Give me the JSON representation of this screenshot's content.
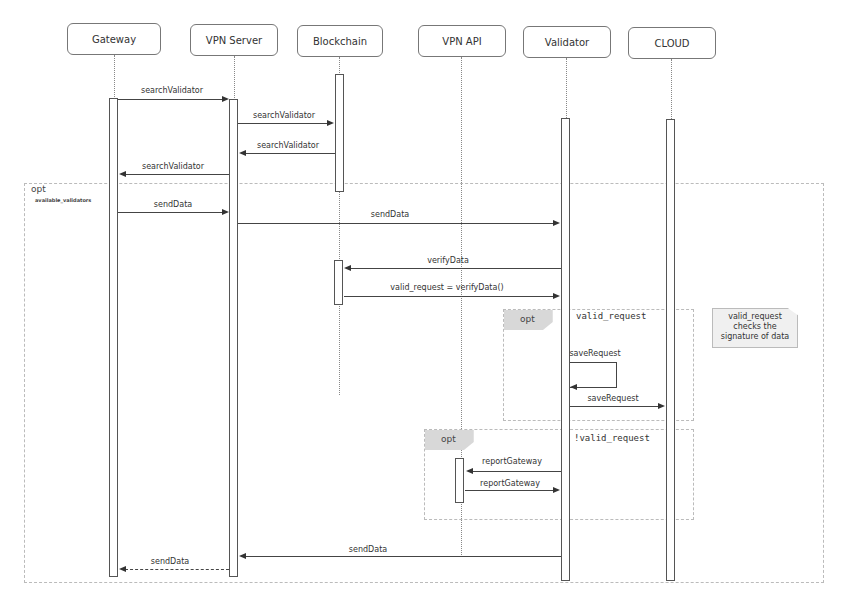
{
  "participants": [
    {
      "id": "gateway",
      "label": "Gateway"
    },
    {
      "id": "vpn_server",
      "label": "VPN Server"
    },
    {
      "id": "blockchain",
      "label": "Blockchain"
    },
    {
      "id": "vpn_api",
      "label": "VPN API"
    },
    {
      "id": "validator",
      "label": "Validator"
    },
    {
      "id": "cloud",
      "label": "CLOUD"
    }
  ],
  "messages": [
    {
      "from": "Gateway",
      "to": "VPN Server",
      "label": "searchValidator"
    },
    {
      "from": "VPN Server",
      "to": "Blockchain",
      "label": "searchValidator"
    },
    {
      "from": "Blockchain",
      "to": "VPN Server",
      "label": "searchValidator"
    },
    {
      "from": "VPN Server",
      "to": "Gateway",
      "label": "searchValidator"
    },
    {
      "from": "Gateway",
      "to": "VPN Server",
      "label": "sendData"
    },
    {
      "from": "VPN Server",
      "to": "Validator",
      "label": "sendData"
    },
    {
      "from": "Validator",
      "to": "Blockchain",
      "label": "verifyData"
    },
    {
      "from": "Blockchain",
      "to": "Validator",
      "label": "valid_request = verifyData()"
    },
    {
      "from": "Validator",
      "to": "Validator",
      "label": "saveRequest"
    },
    {
      "from": "Validator",
      "to": "CLOUD",
      "label": "saveRequest"
    },
    {
      "from": "Validator",
      "to": "VPN API",
      "label": "reportGateway"
    },
    {
      "from": "VPN API",
      "to": "Validator",
      "label": "reportGateway"
    },
    {
      "from": "Validator",
      "to": "VPN Server",
      "label": "sendData"
    },
    {
      "from": "VPN Server",
      "to": "Gateway",
      "label": "sendData"
    }
  ],
  "frames": {
    "outer": {
      "tag": "opt",
      "guard": "available_validators"
    },
    "valid": {
      "tag": "opt",
      "guard": "valid_request"
    },
    "invalid": {
      "tag": "opt",
      "guard": "!valid_request"
    }
  },
  "note": {
    "text": "valid_request checks the signature of data"
  }
}
